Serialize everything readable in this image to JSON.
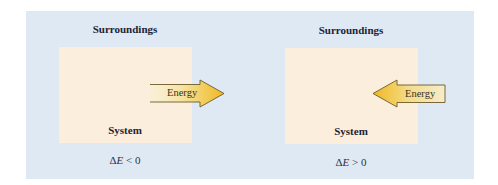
{
  "diagram": {
    "colors": {
      "surroundings_bg": "#dfe9f4",
      "system_bg": "#fbeedd",
      "arrow_yellow": "#f2c12e",
      "arrow_pale": "#f8f0cf",
      "label_text": "#1c2333"
    },
    "panels": [
      {
        "surroundings_label": "Surroundings",
        "system_label": "System",
        "arrow_label": "Energy",
        "arrow_direction": "out-of-system (right)",
        "delta_symbol": "Δ",
        "delta_var": "E",
        "relation": "< 0"
      },
      {
        "surroundings_label": "Surroundings",
        "system_label": "System",
        "arrow_label": "Energy",
        "arrow_direction": "into-system (left)",
        "delta_symbol": "Δ",
        "delta_var": "E",
        "relation": "> 0"
      }
    ]
  }
}
